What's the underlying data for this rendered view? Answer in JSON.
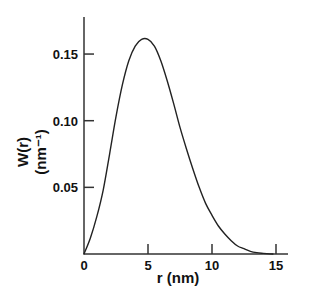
{
  "chart_data": {
    "type": "line",
    "title": "",
    "xlabel": "r (nm)",
    "ylabel": "W(r)",
    "ylabel_units": "(nm⁻¹)",
    "xlim": [
      0,
      16
    ],
    "ylim": [
      0,
      0.175
    ],
    "grid": false,
    "legend": null,
    "x_ticks": [
      0,
      5,
      10,
      15
    ],
    "x_tick_labels": [
      "0",
      "5",
      "10",
      "15"
    ],
    "y_ticks": [
      0.05,
      0.1,
      0.15
    ],
    "y_tick_labels": [
      "0.05",
      "0.10",
      "0.15"
    ],
    "series": [
      {
        "name": "W(r)",
        "color": "#222222",
        "x": [
          0,
          0.5,
          1.0,
          1.5,
          2.0,
          2.5,
          3.0,
          3.5,
          4.0,
          4.5,
          5.0,
          5.5,
          6.0,
          6.5,
          7.0,
          7.5,
          8.0,
          8.5,
          9.0,
          9.5,
          10.0,
          10.5,
          11.0,
          11.5,
          12.0,
          12.5,
          13.0,
          13.5,
          14.0,
          14.5,
          14.8
        ],
        "values": [
          0,
          0.012,
          0.028,
          0.048,
          0.075,
          0.103,
          0.127,
          0.145,
          0.156,
          0.161,
          0.161,
          0.156,
          0.145,
          0.13,
          0.113,
          0.095,
          0.079,
          0.064,
          0.05,
          0.038,
          0.029,
          0.021,
          0.015,
          0.01,
          0.006,
          0.004,
          0.002,
          0.001,
          0.0005,
          0.0001,
          0
        ]
      }
    ]
  }
}
